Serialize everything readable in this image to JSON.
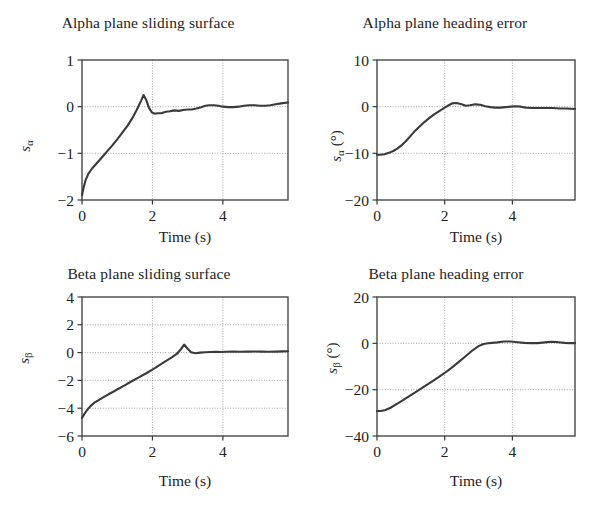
{
  "figure": {
    "background": "#ffffff",
    "ink_color": "#3a3a3a",
    "text_color": "#221e1f",
    "grid_color": "#909090"
  },
  "panels": [
    {
      "id": "alpha-sliding-surface",
      "title": "Alpha plane sliding surface",
      "xlabel": "Time (s)",
      "ylabel_base": "s",
      "ylabel_sub": "α",
      "ylabel_unit": "",
      "xticks": [
        "0",
        "2",
        "4"
      ],
      "yticks": [
        "1",
        "0",
        "−1",
        "−2"
      ]
    },
    {
      "id": "alpha-heading-error",
      "title": "Alpha plane heading error",
      "xlabel": "Time (s)",
      "ylabel_base": "s",
      "ylabel_sub": "α",
      "ylabel_unit": " (°)",
      "xticks": [
        "0",
        "2",
        "4"
      ],
      "yticks": [
        "10",
        "0",
        "−10",
        "−20"
      ]
    },
    {
      "id": "beta-sliding-surface",
      "title": "Beta plane sliding surface",
      "xlabel": "Time (s)",
      "ylabel_base": "s",
      "ylabel_sub": "β",
      "ylabel_unit": "",
      "xticks": [
        "0",
        "2",
        "4"
      ],
      "yticks": [
        "4",
        "2",
        "0",
        "−2",
        "−4",
        "−6"
      ]
    },
    {
      "id": "beta-heading-error",
      "title": "Beta plane heading error",
      "xlabel": "Time (s)",
      "ylabel_base": "s",
      "ylabel_sub": "β",
      "ylabel_unit": " (°)",
      "xticks": [
        "0",
        "2",
        "4"
      ],
      "yticks": [
        "20",
        "0",
        "−20",
        "−40"
      ]
    }
  ],
  "chart_data": [
    {
      "type": "line",
      "title": "Alpha plane sliding surface",
      "xlabel": "Time (s)",
      "ylabel": "s_alpha",
      "xlim": [
        0,
        5.85
      ],
      "ylim": [
        -2,
        1
      ],
      "xticks": [
        0,
        2,
        4
      ],
      "yticks": [
        -2,
        -1,
        0,
        1
      ],
      "grid": true,
      "legend": null,
      "series": [
        {
          "name": "s_alpha",
          "x": [
            0.0,
            0.05,
            0.1,
            0.18,
            0.28,
            0.4,
            0.55,
            0.7,
            0.85,
            1.0,
            1.15,
            1.3,
            1.45,
            1.58,
            1.68,
            1.75,
            1.82,
            1.9,
            1.98,
            2.06,
            2.15,
            2.25,
            2.38,
            2.5,
            2.62,
            2.75,
            2.88,
            3.0,
            3.12,
            3.25,
            3.38,
            3.5,
            3.62,
            3.75,
            3.88,
            4.0,
            4.15,
            4.3,
            4.45,
            4.6,
            4.75,
            4.9,
            5.05,
            5.2,
            5.35,
            5.5,
            5.65,
            5.85
          ],
          "y": [
            -1.9,
            -1.72,
            -1.58,
            -1.44,
            -1.33,
            -1.23,
            -1.1,
            -0.97,
            -0.84,
            -0.7,
            -0.55,
            -0.4,
            -0.22,
            -0.03,
            0.13,
            0.25,
            0.15,
            -0.02,
            -0.12,
            -0.15,
            -0.14,
            -0.14,
            -0.11,
            -0.1,
            -0.08,
            -0.09,
            -0.07,
            -0.06,
            -0.06,
            -0.04,
            -0.01,
            0.02,
            0.03,
            0.03,
            0.02,
            0.0,
            -0.01,
            -0.01,
            0.0,
            0.02,
            0.03,
            0.03,
            0.02,
            0.02,
            0.03,
            0.05,
            0.07,
            0.09
          ]
        }
      ]
    },
    {
      "type": "line",
      "title": "Alpha plane heading error",
      "xlabel": "Time (s)",
      "ylabel": "s_alpha (deg)",
      "xlim": [
        0,
        5.85
      ],
      "ylim": [
        -20,
        10
      ],
      "xticks": [
        0,
        2,
        4
      ],
      "yticks": [
        -20,
        -10,
        0,
        10
      ],
      "grid": true,
      "legend": null,
      "series": [
        {
          "name": "s_alpha_deg",
          "x": [
            0.0,
            0.1,
            0.22,
            0.35,
            0.48,
            0.6,
            0.72,
            0.85,
            1.0,
            1.12,
            1.25,
            1.4,
            1.55,
            1.7,
            1.85,
            2.0,
            2.12,
            2.22,
            2.35,
            2.5,
            2.62,
            2.75,
            2.9,
            3.05,
            3.2,
            3.35,
            3.5,
            3.65,
            3.8,
            3.95,
            4.1,
            4.25,
            4.4,
            4.6,
            4.8,
            5.0,
            5.2,
            5.4,
            5.6,
            5.85
          ],
          "y": [
            -10.3,
            -10.3,
            -10.2,
            -9.9,
            -9.5,
            -9.0,
            -8.3,
            -7.4,
            -6.2,
            -5.2,
            -4.3,
            -3.3,
            -2.4,
            -1.6,
            -0.9,
            -0.2,
            0.3,
            0.7,
            0.8,
            0.5,
            0.2,
            0.3,
            0.5,
            0.4,
            0.1,
            -0.1,
            -0.2,
            -0.2,
            -0.1,
            0.0,
            0.1,
            0.0,
            -0.2,
            -0.3,
            -0.3,
            -0.3,
            -0.3,
            -0.4,
            -0.4,
            -0.5
          ]
        }
      ]
    },
    {
      "type": "line",
      "title": "Beta plane sliding surface",
      "xlabel": "Time (s)",
      "ylabel": "s_beta",
      "xlim": [
        0,
        5.85
      ],
      "ylim": [
        -6,
        4
      ],
      "xticks": [
        0,
        2,
        4
      ],
      "yticks": [
        -6,
        -4,
        -2,
        0,
        2,
        4
      ],
      "grid": true,
      "legend": null,
      "series": [
        {
          "name": "s_beta",
          "x": [
            0.0,
            0.06,
            0.14,
            0.24,
            0.34,
            0.45,
            0.6,
            0.75,
            0.9,
            1.05,
            1.2,
            1.4,
            1.6,
            1.8,
            2.0,
            2.2,
            2.4,
            2.55,
            2.7,
            2.8,
            2.9,
            3.0,
            3.1,
            3.22,
            3.35,
            3.5,
            3.65,
            3.8,
            3.95,
            4.1,
            4.3,
            4.5,
            4.7,
            4.9,
            5.1,
            5.3,
            5.5,
            5.7,
            5.85
          ],
          "y": [
            -4.7,
            -4.45,
            -4.15,
            -3.85,
            -3.62,
            -3.45,
            -3.22,
            -3.0,
            -2.8,
            -2.58,
            -2.38,
            -2.08,
            -1.8,
            -1.52,
            -1.22,
            -0.9,
            -0.58,
            -0.35,
            -0.08,
            0.22,
            0.58,
            0.28,
            0.02,
            -0.05,
            0.0,
            0.03,
            0.04,
            0.05,
            0.04,
            0.06,
            0.07,
            0.06,
            0.07,
            0.08,
            0.07,
            0.06,
            0.07,
            0.09,
            0.1
          ]
        }
      ]
    },
    {
      "type": "line",
      "title": "Beta plane heading error",
      "xlabel": "Time (s)",
      "ylabel": "s_beta (deg)",
      "xlim": [
        0,
        5.85
      ],
      "ylim": [
        -40,
        20
      ],
      "xticks": [
        0,
        2,
        4
      ],
      "yticks": [
        -40,
        -20,
        0,
        20
      ],
      "grid": true,
      "legend": null,
      "series": [
        {
          "name": "s_beta_deg",
          "x": [
            0.0,
            0.12,
            0.25,
            0.4,
            0.55,
            0.7,
            0.85,
            1.0,
            1.2,
            1.4,
            1.6,
            1.8,
            2.0,
            2.2,
            2.4,
            2.6,
            2.8,
            3.0,
            3.15,
            3.28,
            3.4,
            3.55,
            3.75,
            3.95,
            4.15,
            4.35,
            4.55,
            4.75,
            4.95,
            5.15,
            5.35,
            5.55,
            5.7,
            5.85
          ],
          "y": [
            -29.2,
            -29.2,
            -28.8,
            -27.8,
            -26.5,
            -25.2,
            -23.8,
            -22.4,
            -20.5,
            -18.6,
            -16.7,
            -14.8,
            -12.8,
            -10.6,
            -8.2,
            -5.8,
            -3.3,
            -1.2,
            -0.3,
            0.0,
            0.2,
            0.4,
            0.8,
            0.8,
            0.5,
            0.2,
            0.1,
            0.1,
            0.4,
            0.7,
            0.5,
            0.2,
            0.1,
            0.1
          ]
        }
      ]
    }
  ]
}
